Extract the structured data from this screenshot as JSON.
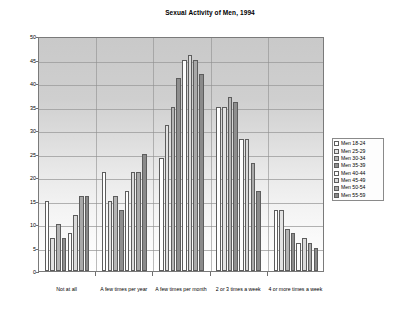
{
  "chart_data": {
    "type": "bar",
    "title": "Sexual Activity of Men, 1994",
    "xlabel": "",
    "ylabel": "Percent",
    "ylim": [
      0,
      50
    ],
    "ytick_step": 5,
    "yticks": [
      0,
      5,
      10,
      15,
      20,
      25,
      30,
      35,
      40,
      45,
      50
    ],
    "grid": true,
    "legend_position": "right",
    "categories": [
      "Not at all",
      "A few times per year",
      "A few times per month",
      "2 or 3 times a week",
      "4 or more times a week"
    ],
    "series": [
      {
        "name": "Men 18-24",
        "values": [
          15,
          21,
          24,
          35,
          13
        ]
      },
      {
        "name": "Men 25-29",
        "values": [
          7,
          15,
          31,
          35,
          13
        ]
      },
      {
        "name": "Men 30-34",
        "values": [
          10,
          16,
          35,
          37,
          9
        ]
      },
      {
        "name": "Men 35-39",
        "values": [
          7,
          13,
          41,
          36,
          8
        ]
      },
      {
        "name": "Men 40-44",
        "values": [
          8,
          17,
          45,
          28,
          6
        ]
      },
      {
        "name": "Men 45-49",
        "values": [
          12,
          21,
          46,
          28,
          7
        ]
      },
      {
        "name": "Men 50-54",
        "values": [
          16,
          21,
          45,
          23,
          6
        ]
      },
      {
        "name": "Men 55-59",
        "values": [
          16,
          25,
          42,
          17,
          5
        ]
      }
    ]
  },
  "legend": {
    "items": [
      "Men 18-24",
      "Men 25-29",
      "Men 30-34",
      "Men 35-39",
      "Men 40-44",
      "Men 45-49",
      "Men 50-54",
      "Men 55-59"
    ]
  }
}
